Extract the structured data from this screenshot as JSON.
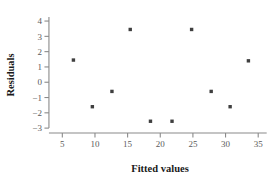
{
  "chart_data": {
    "type": "scatter",
    "title": "",
    "xlabel": "Fitted values",
    "ylabel": "Residuals",
    "xlim": [
      2.5,
      36.5
    ],
    "ylim": [
      -3.45,
      4.2
    ],
    "xticks": [
      5,
      10,
      15,
      20,
      25,
      30,
      35
    ],
    "xtick_labels": [
      "5",
      "10",
      "15",
      "20",
      "25",
      "30",
      "35"
    ],
    "yticks": [
      -3,
      -2,
      -1,
      0,
      1,
      2,
      3,
      4
    ],
    "ytick_labels": [
      "−3",
      "−2",
      "−1",
      "0",
      "1",
      "2",
      "3",
      "4"
    ],
    "grid": false,
    "legend": null,
    "marker": "square-dot",
    "marker_color": "#3f3f3f",
    "axis_color": "#8a8a8a",
    "points": [
      {
        "x": 6.7,
        "y": 1.45
      },
      {
        "x": 9.6,
        "y": -1.6
      },
      {
        "x": 12.6,
        "y": -0.6
      },
      {
        "x": 15.4,
        "y": 3.45
      },
      {
        "x": 18.5,
        "y": -2.55
      },
      {
        "x": 21.8,
        "y": -2.55
      },
      {
        "x": 24.8,
        "y": 3.45
      },
      {
        "x": 27.8,
        "y": -0.6
      },
      {
        "x": 30.7,
        "y": -1.6
      },
      {
        "x": 33.5,
        "y": 1.4
      }
    ]
  }
}
